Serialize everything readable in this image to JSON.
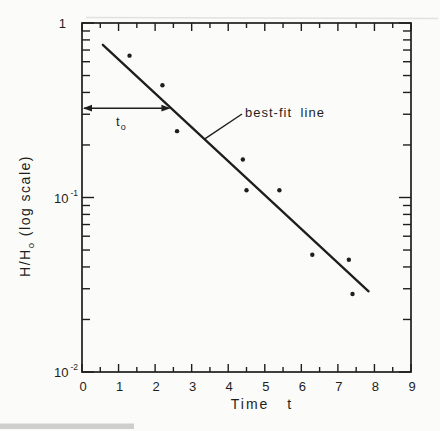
{
  "figure": {
    "background": "#fbfbf9",
    "ink": "#1e1e1c"
  },
  "chart_data": {
    "type": "scatter",
    "title": "",
    "xlabel": "Time t",
    "ylabel": "H/Hₒ (log scale)",
    "ylabel_parts": {
      "pre": "H/H",
      "sub": "o",
      "post": " (log scale)"
    },
    "x_range": [
      0,
      9
    ],
    "y_scale": "log",
    "y_range": [
      0.01,
      1
    ],
    "grid": false,
    "legend": "none",
    "x_axis": {
      "major_ticks": [
        0,
        1,
        2,
        3,
        4,
        5,
        6,
        7,
        8,
        9
      ],
      "major_tick_labels": [
        "0",
        "1",
        "2",
        "3",
        "4",
        "5",
        "6",
        "7",
        "8",
        "9"
      ],
      "minor_tick_step": 0.5
    },
    "y_axis": {
      "major_ticks": [
        1,
        0.1,
        0.01
      ],
      "major_tick_labels": [
        {
          "text": "1"
        },
        {
          "base": "10",
          "exp": "-1"
        },
        {
          "base": "10",
          "exp": "-2"
        }
      ],
      "minor_ticks": [
        0.9,
        0.8,
        0.7,
        0.6,
        0.5,
        0.4,
        0.3,
        0.2,
        0.09,
        0.08,
        0.07,
        0.06,
        0.05,
        0.04,
        0.03,
        0.02
      ]
    },
    "points": [
      [
        1.3,
        0.65
      ],
      [
        2.2,
        0.44
      ],
      [
        2.6,
        0.24
      ],
      [
        4.4,
        0.165
      ],
      [
        4.5,
        0.11
      ],
      [
        5.4,
        0.11
      ],
      [
        6.3,
        0.047
      ],
      [
        7.3,
        0.044
      ],
      [
        7.4,
        0.028
      ]
    ],
    "best_fit_line": {
      "x1": 0.57,
      "y1": 0.75,
      "x2": 7.84,
      "y2": 0.029
    },
    "annotations": {
      "best_fit_label": "best-fit line",
      "time_lag_label": "tₒ",
      "time_lag_label_parts": {
        "base": "t",
        "sub": "o"
      },
      "arrow_y": 0.325,
      "arrow_x1": 0,
      "arrow_x2": 2.42
    }
  }
}
